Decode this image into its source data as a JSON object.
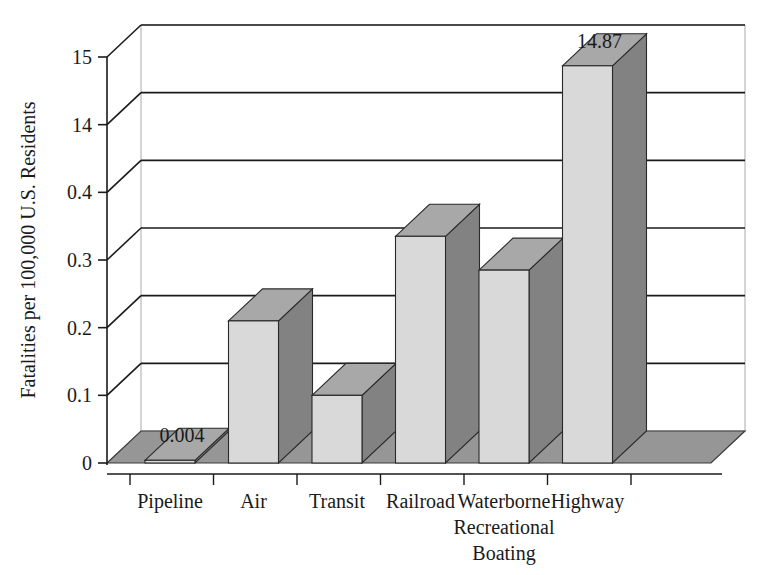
{
  "chart_data": {
    "type": "bar",
    "title": "",
    "xlabel": "",
    "ylabel": "Fatalities per 100,000 U.S. Residents",
    "categories": [
      "Pipeline",
      "Air",
      "Transit",
      "Railroad",
      "Waterborne Recreational Boating",
      "Highway"
    ],
    "category_lines": [
      [
        "Pipeline"
      ],
      [
        "Air"
      ],
      [
        "Transit"
      ],
      [
        "Railroad"
      ],
      [
        "Waterborne",
        "Recreational",
        "Boating"
      ],
      [
        "Highway"
      ]
    ],
    "values": [
      0.004,
      0.21,
      0.1,
      0.335,
      0.285,
      14.87
    ],
    "data_labels": {
      "Pipeline": "0.004",
      "Highway": "14.87"
    },
    "ytick_labels": [
      "0",
      "0.1",
      "0.2",
      "0.3",
      "0.4",
      "14",
      "15"
    ],
    "ytick_values": [
      0,
      0.1,
      0.2,
      0.3,
      0.4,
      14,
      15
    ],
    "axis_note": "broken / non-linear y-axis: equal spacing between 0, 0.1, 0.2, 0.3, 0.4, 14, 15",
    "ylim": [
      0,
      15
    ],
    "grid": true,
    "legend": "none",
    "style": "3d-column",
    "colors": {
      "bar_front": "#d9d9d9",
      "bar_side": "#828282",
      "bar_top": "#a8a8a8",
      "floor": "#969696",
      "wall": "#ffffff",
      "gridline": "#1a1a1a",
      "axis": "#1a1a1a",
      "text": "#1a1a1a"
    }
  }
}
